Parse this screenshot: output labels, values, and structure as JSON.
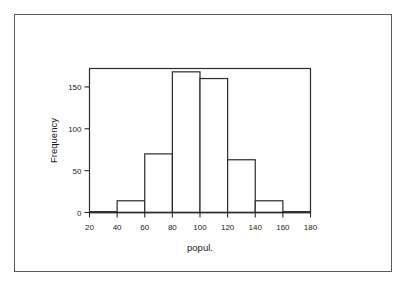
{
  "figure": {
    "background_color": "#ffffff",
    "border_color": "#5a5a5a",
    "axis_color": "#2b2b2b",
    "bar_edge_color": "#2b2b2b",
    "bar_fill_color": "#ffffff"
  },
  "chart_data": {
    "type": "bar",
    "title": "",
    "subtitle": "",
    "xlabel": "popul.",
    "ylabel": "Frequency",
    "categories": [
      "20-40",
      "40-60",
      "60-80",
      "80-100",
      "100-120",
      "120-140",
      "140-160",
      "160-180"
    ],
    "bin_edges": [
      20,
      40,
      60,
      80,
      100,
      120,
      140,
      160,
      180
    ],
    "values": [
      1,
      14,
      70,
      168,
      160,
      63,
      14,
      1
    ],
    "xlim": [
      20,
      180
    ],
    "ylim": [
      0,
      172
    ],
    "xticks": [
      20,
      40,
      60,
      80,
      100,
      120,
      140,
      160,
      180
    ],
    "xtick_labels": [
      "20",
      "40",
      "60",
      "80",
      "100",
      "120",
      "140",
      "160",
      "180"
    ],
    "yticks": [
      0,
      50,
      100,
      150
    ],
    "ytick_labels": [
      "0",
      "50",
      "100",
      "150"
    ],
    "grid": false,
    "legend": null,
    "legend_position": "none",
    "annotations": []
  }
}
